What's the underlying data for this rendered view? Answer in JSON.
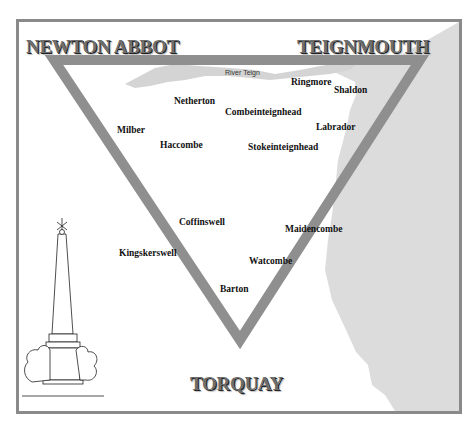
{
  "map": {
    "corners": {
      "top_left": "NEWTON ABBOT",
      "top_right": "TEIGNMOUTH",
      "bottom": "TORQUAY"
    },
    "river_label": "River Teign",
    "places": [
      {
        "name": "Ringmore",
        "x": 291,
        "y": 77
      },
      {
        "name": "Shaldon",
        "x": 334,
        "y": 85
      },
      {
        "name": "Netherton",
        "x": 174,
        "y": 96
      },
      {
        "name": "Combeinteignhead",
        "x": 225,
        "y": 107
      },
      {
        "name": "Labrador",
        "x": 316,
        "y": 122
      },
      {
        "name": "Milber",
        "x": 117,
        "y": 125
      },
      {
        "name": "Haccombe",
        "x": 160,
        "y": 140
      },
      {
        "name": "Stokeinteignhead",
        "x": 248,
        "y": 142
      },
      {
        "name": "Coffinswell",
        "x": 179,
        "y": 217
      },
      {
        "name": "Maidencombe",
        "x": 285,
        "y": 224
      },
      {
        "name": "Kingskerswell",
        "x": 119,
        "y": 248
      },
      {
        "name": "Watcombe",
        "x": 249,
        "y": 256
      },
      {
        "name": "Barton",
        "x": 220,
        "y": 284
      }
    ],
    "colors": {
      "frame": "#8a8a8a",
      "triangle": "#8f8f8f",
      "sea": "#dcdcdc",
      "text": "#111111"
    },
    "illustration": "obelisk-monument"
  }
}
